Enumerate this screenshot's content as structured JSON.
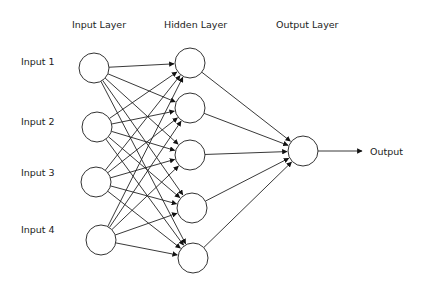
{
  "headers": {
    "input_layer": "Input Layer",
    "hidden_layer": "Hidden Layer",
    "output_layer": "Output Layer"
  },
  "inputs": [
    {
      "label": "Input 1"
    },
    {
      "label": "Input 2"
    },
    {
      "label": "Input 3"
    },
    {
      "label": "Input 4"
    }
  ],
  "output": {
    "label": "Output"
  },
  "structure": {
    "input_nodes": 4,
    "hidden_nodes": 5,
    "output_nodes": 1,
    "connections": "fully connected feedforward"
  }
}
